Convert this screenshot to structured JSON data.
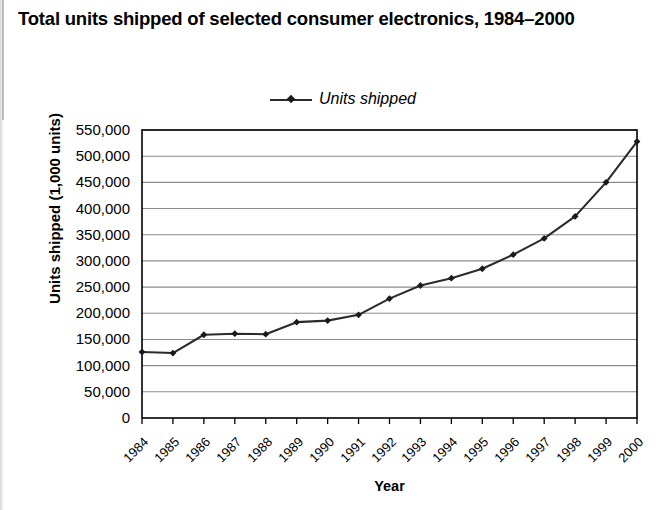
{
  "title": "Total units shipped of selected consumer electronics, 1984–2000",
  "legend": {
    "label": "Units shipped",
    "marker": "diamond-marker",
    "position": "top-center"
  },
  "axes": {
    "x_title": "Year",
    "y_title": "Units shipped (1,000 units)"
  },
  "colors": {
    "line": "#2b2b2b",
    "marker": "#1a1a1a",
    "grid": "#8c8c8c",
    "axis": "#000000",
    "background": "#ffffff"
  },
  "chart_data": {
    "type": "line",
    "title": "Total units shipped of selected consumer electronics, 1984–2000",
    "xlabel": "Year",
    "ylabel": "Units shipped (1,000 units)",
    "categories": [
      "1984",
      "1985",
      "1986",
      "1987",
      "1988",
      "1989",
      "1990",
      "1991",
      "1992",
      "1993",
      "1994",
      "1995",
      "1996",
      "1997",
      "1998",
      "1999",
      "2000"
    ],
    "series": [
      {
        "name": "Units shipped",
        "values": [
          126000,
          124000,
          159000,
          161000,
          160000,
          183000,
          186000,
          197000,
          228000,
          253000,
          267000,
          285000,
          312000,
          343000,
          385000,
          450000,
          528000
        ]
      }
    ],
    "ylim": [
      0,
      550000
    ],
    "yticks": [
      0,
      50000,
      100000,
      150000,
      200000,
      250000,
      300000,
      350000,
      400000,
      450000,
      500000,
      550000
    ],
    "ytick_labels": [
      "0",
      "50,000",
      "100,000",
      "150,000",
      "200,000",
      "250,000",
      "300,000",
      "350,000",
      "400,000",
      "450,000",
      "500,000",
      "550,000"
    ],
    "grid": "horizontal",
    "legend_position": "top-center",
    "marker": "diamond"
  }
}
